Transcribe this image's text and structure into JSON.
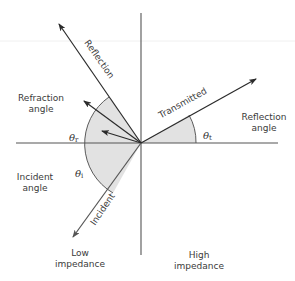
{
  "diagram": {
    "origin": {
      "x": 141,
      "y": 143
    },
    "colors": {
      "line": "#2b2b2b",
      "axis": "#555555",
      "arc_fill": "#e2e2e2",
      "arc_stroke": "#4a4a4a",
      "text": "#3a3a3a"
    },
    "rays": [
      {
        "name": "reflection",
        "label": "Reflection",
        "to": {
          "x": 59,
          "y": 24
        }
      },
      {
        "name": "refracted-1",
        "label": "",
        "to": {
          "x": 84,
          "y": 101
        }
      },
      {
        "name": "refracted-2",
        "label": "",
        "to": {
          "x": 102,
          "y": 131
        }
      },
      {
        "name": "transmitted",
        "label": "Transmitted",
        "to": {
          "x": 256,
          "y": 79
        }
      },
      {
        "name": "incident",
        "label": "Incident",
        "to": {
          "x": 73,
          "y": 237
        }
      }
    ],
    "labels": {
      "reflection": "Reflection",
      "transmitted": "Transmitted",
      "incident": "Incident",
      "refraction_angle_line1": "Refraction",
      "refraction_angle_line2": "angle",
      "incident_angle_line1": "Incident",
      "incident_angle_line2": "angle",
      "reflection_angle_line1": "Reflection",
      "reflection_angle_line2": "angle",
      "low_impedance_line1": "Low",
      "low_impedance_line2": "impedance",
      "high_impedance_line1": "High",
      "high_impedance_line2": "impedance"
    },
    "angles": {
      "theta_r": {
        "symbol": "θ",
        "sub": "r"
      },
      "theta_i": {
        "symbol": "θ",
        "sub": "i"
      },
      "theta_t": {
        "symbol": "θ",
        "sub": "t"
      }
    }
  }
}
